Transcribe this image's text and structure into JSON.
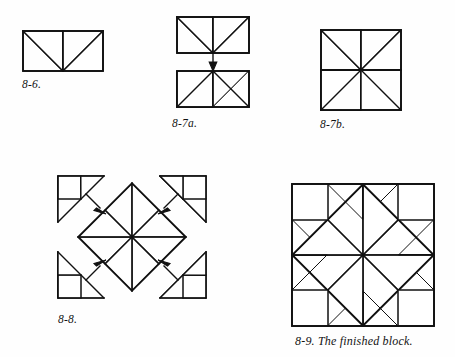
{
  "page": {
    "kind": "quilt-block-instruction-illustrations",
    "background_color": "#fefefe",
    "ink_color": "#111111",
    "print_texture": "dotted-fabric-shading"
  },
  "figures": [
    {
      "id": "fig-8-6",
      "caption": "8-6.",
      "description": "Two pieced squares joined into a rectangle; each square has one dotted print triangle and one plain triangle.",
      "units": 2,
      "x": 22,
      "y": 30,
      "w": 82,
      "h": 41
    },
    {
      "id": "fig-8-7a",
      "caption": "8-7a.",
      "description": "Two pieced rectangles shown one above the other with a joining arrow between them.",
      "units": 4,
      "x": 176,
      "y": 16,
      "w": 84,
      "h": 88,
      "arrow": "down"
    },
    {
      "id": "fig-8-7b",
      "caption": "8-7b.",
      "description": "The two rectangles sewn together to form a pinwheel square.",
      "units": 4,
      "x": 320,
      "y": 29,
      "w": 80,
      "h": 80
    },
    {
      "id": "fig-8-8",
      "caption": "8-8.",
      "description": "Center pinwheel set on point with four corner units, arrows showing how corner units are joined.",
      "x": 58,
      "y": 172,
      "w": 148,
      "h": 130,
      "arrows": 4
    },
    {
      "id": "fig-8-9",
      "caption": "8-9.  The finished block.",
      "caption_number": "8-9.",
      "caption_text": "The finished block.",
      "description": "The completed quilt block: a pinwheel on point framed by dotted print triangles and plain corner squares.",
      "x": 290,
      "y": 182,
      "w": 142,
      "h": 142
    }
  ],
  "captions": {
    "fig_8_6": "8-6.",
    "fig_8_7a": "8-7a.",
    "fig_8_7b": "8-7b.",
    "fig_8_8": "8-8.",
    "fig_8_9": "8-9.  The finished block."
  }
}
